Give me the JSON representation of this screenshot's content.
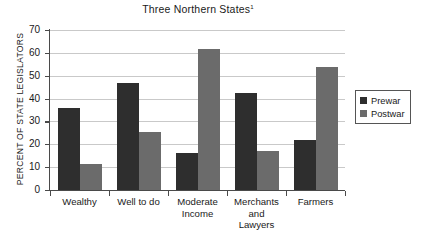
{
  "chart_data": {
    "type": "bar",
    "title": "Three Northern States",
    "title_footnote_marker": "1",
    "xlabel": "",
    "ylabel": "PERCENT OF STATE LEGISLATORS",
    "ylim": [
      0,
      70
    ],
    "yticks": [
      0,
      10,
      20,
      30,
      40,
      50,
      60,
      70
    ],
    "grid": true,
    "legend_position": "right",
    "categories": [
      "Wealthy",
      "Well to do",
      "Moderate Income",
      "Merchants and Lawyers",
      "Farmers"
    ],
    "category_label_lines": [
      [
        "Wealthy"
      ],
      [
        "Well to do"
      ],
      [
        "Moderate",
        "Income"
      ],
      [
        "Merchants",
        "and",
        "Lawyers"
      ],
      [
        "Farmers"
      ]
    ],
    "series": [
      {
        "name": "Prewar",
        "color": "#2e2e2e",
        "values": [
          36,
          47,
          16,
          42.5,
          22
        ]
      },
      {
        "name": "Postwar",
        "color": "#6b6b6b",
        "values": [
          11.5,
          25.5,
          61.5,
          17,
          54
        ]
      }
    ]
  },
  "legend": {
    "entries": [
      {
        "label": "Prewar"
      },
      {
        "label": "Postwar"
      }
    ]
  }
}
